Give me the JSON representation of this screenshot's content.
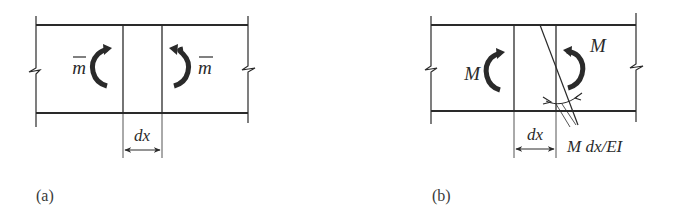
{
  "figure": {
    "panels": [
      {
        "caption": "(a)",
        "left_moment_label": "m",
        "right_moment_label": "m",
        "moment_overbar": true,
        "element_width_label": "dx"
      },
      {
        "caption": "(b)",
        "left_moment_label": "M",
        "right_moment_label": "M",
        "element_width_label": "dx",
        "rotation_label": "M dx/EI"
      }
    ],
    "colors": {
      "line": "#2a2a2a",
      "background": "#ffffff"
    }
  }
}
